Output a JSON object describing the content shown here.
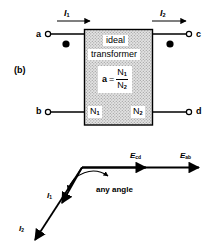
{
  "figure": {
    "label": "(b)",
    "caption_letter": "(b)"
  },
  "transformer": {
    "title_line1": "ideal",
    "title_line2": "transformer",
    "ratio": {
      "symbol": "a",
      "equals": "=",
      "numerator": "N",
      "numerator_sub": "1",
      "denominator": "N",
      "denominator_sub": "2"
    },
    "winding_primary": "N",
    "winding_primary_sub": "1",
    "winding_secondary": "N",
    "winding_secondary_sub": "2",
    "box_fill_color": "#d7d7d7",
    "box_border_color": "#000000"
  },
  "terminals": {
    "top_left": "a",
    "bottom_left": "b",
    "top_right": "c",
    "bottom_right": "d"
  },
  "currents": {
    "primary": "I",
    "primary_sub": "1",
    "secondary": "I",
    "secondary_sub": "2"
  },
  "polarity_dots": {
    "left": "dot",
    "right": "dot"
  },
  "phasor_diagram": {
    "voltage_cd": "E",
    "voltage_cd_sub": "cd",
    "voltage_ab": "E",
    "voltage_ab_sub": "ab",
    "current_1": "I",
    "current_1_sub": "1",
    "current_2": "I",
    "current_2_sub": "2",
    "angle_note": "any angle"
  }
}
